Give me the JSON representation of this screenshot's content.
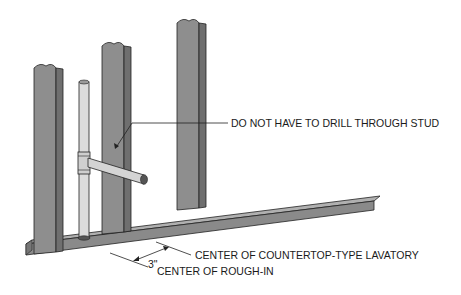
{
  "diagram": {
    "type": "plumbing-framing-illustration",
    "callouts": {
      "stud_note": "DO NOT HAVE TO DRILL THROUGH STUD",
      "lavatory_center": "CENTER OF COUNTERTOP-TYPE LAVATORY",
      "rough_in_center": "CENTER OF ROUGH-IN",
      "offset_dimension": "3\""
    },
    "components": [
      "stud-left",
      "stud-middle",
      "stud-right",
      "bottom-plate",
      "vertical-pipe",
      "tee-fitting",
      "horizontal-pipe-stub"
    ],
    "colors": {
      "stud_fill": "#8c8c8c",
      "stud_edge": "#6e6e6e",
      "plate_fill": "#9a9a9a",
      "pipe_fill": "#d9d9d9",
      "line": "#222222"
    }
  }
}
